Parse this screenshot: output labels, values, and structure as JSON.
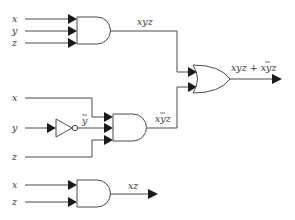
{
  "diagram": {
    "type": "logic-circuit",
    "circuit1": {
      "inputs": [
        "x",
        "y",
        "z"
      ],
      "gate": "AND",
      "output_label": "xyz"
    },
    "circuit2": {
      "inputs": [
        "x",
        "y",
        "z"
      ],
      "inverter_output_label": "y",
      "inverter_output_overline": true,
      "gate": "AND",
      "output_label_parts": [
        "x",
        "y",
        "z"
      ],
      "output_label_overline_index": 1
    },
    "or_gate": {
      "gate": "OR",
      "output_label_prefix": "xyz + x",
      "output_label_overlined": "y",
      "output_label_suffix": "z"
    },
    "circuit3": {
      "inputs": [
        "x",
        "z"
      ],
      "gate": "AND",
      "output_label": "xz"
    },
    "colors": {
      "wire": "#4a4a4a",
      "arrow": "#1a1a1a",
      "text": "#3a3a3a",
      "background": "#ffffff"
    }
  }
}
